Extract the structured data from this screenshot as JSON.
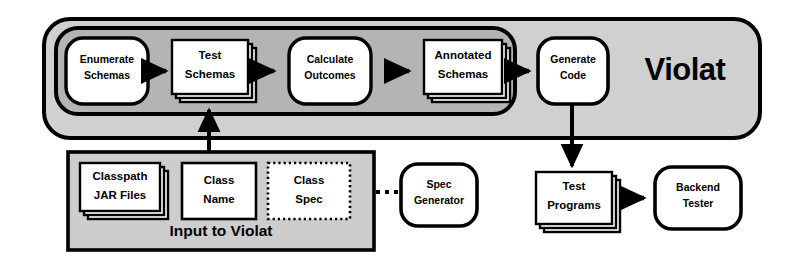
{
  "diagram": {
    "title": "Violat",
    "brand_label": "Violat",
    "input_group_label": "Input to Violat",
    "colors": {
      "background": "#ffffff",
      "outer_container_fill": "#d0d0d0",
      "inner_pipeline_fill": "#b4b4b4",
      "input_group_fill": "#cdcdcd",
      "node_fill": "#ffffff",
      "stroke": "#000000"
    },
    "containers": [
      {
        "id": "violat-container",
        "label": "Violat",
        "shape": "rounded-rectangle",
        "fill": "#d0d0d0"
      },
      {
        "id": "pipeline-band",
        "label": "",
        "shape": "rounded-rectangle",
        "fill": "#b4b4b4"
      },
      {
        "id": "input-to-violat",
        "label": "Input to Violat",
        "shape": "rectangle",
        "fill": "#cdcdcd"
      }
    ],
    "nodes": [
      {
        "id": "enumerate-schemas",
        "lines": [
          "Enumerate",
          "Schemas"
        ],
        "shape": "rounded",
        "stacked": false,
        "border": "solid"
      },
      {
        "id": "test-schemas",
        "lines": [
          "Test",
          "Schemas"
        ],
        "shape": "stack",
        "stacked": true,
        "border": "solid"
      },
      {
        "id": "calculate-outcomes",
        "lines": [
          "Calculate",
          "Outcomes"
        ],
        "shape": "rounded",
        "stacked": false,
        "border": "solid"
      },
      {
        "id": "annotated-schemas",
        "lines": [
          "Annotated",
          "Schemas"
        ],
        "shape": "stack",
        "stacked": true,
        "border": "solid"
      },
      {
        "id": "generate-code",
        "lines": [
          "Generate",
          "Code"
        ],
        "shape": "rounded",
        "stacked": false,
        "border": "solid"
      },
      {
        "id": "classpath-jar-files",
        "lines": [
          "Classpath",
          "JAR Files"
        ],
        "shape": "stack",
        "stacked": true,
        "border": "solid"
      },
      {
        "id": "class-name",
        "lines": [
          "Class",
          "Name"
        ],
        "shape": "rect",
        "stacked": false,
        "border": "solid"
      },
      {
        "id": "class-spec",
        "lines": [
          "Class",
          "Spec"
        ],
        "shape": "rect",
        "stacked": false,
        "border": "dotted"
      },
      {
        "id": "spec-generator",
        "lines": [
          "Spec",
          "Generator"
        ],
        "shape": "rounded",
        "stacked": false,
        "border": "solid"
      },
      {
        "id": "test-programs",
        "lines": [
          "Test",
          "Programs"
        ],
        "shape": "stack",
        "stacked": true,
        "border": "solid"
      },
      {
        "id": "backend-tester",
        "lines": [
          "Backend",
          "Tester"
        ],
        "shape": "rounded",
        "stacked": false,
        "border": "solid"
      }
    ],
    "edges": [
      {
        "id": "enumerate-to-test",
        "from": "enumerate-schemas",
        "to": "test-schemas",
        "style": "solid",
        "direction": "right"
      },
      {
        "id": "test-to-calculate",
        "from": "test-schemas",
        "to": "calculate-outcomes",
        "style": "solid",
        "direction": "right"
      },
      {
        "id": "calculate-to-annotated",
        "from": "calculate-outcomes",
        "to": "annotated-schemas",
        "style": "solid",
        "direction": "right"
      },
      {
        "id": "annotated-to-generate",
        "from": "annotated-schemas",
        "to": "generate-code",
        "style": "solid",
        "direction": "right"
      },
      {
        "id": "input-to-pipeline",
        "from": "input-to-violat",
        "to": "pipeline-band",
        "style": "solid",
        "direction": "up"
      },
      {
        "id": "generate-to-test-programs",
        "from": "generate-code",
        "to": "test-programs",
        "style": "solid",
        "direction": "down"
      },
      {
        "id": "test-programs-to-backend",
        "from": "test-programs",
        "to": "backend-tester",
        "style": "solid",
        "direction": "right"
      },
      {
        "id": "class-spec-to-spec-generator",
        "from": "class-spec",
        "to": "spec-generator",
        "style": "dotted",
        "direction": "left"
      }
    ]
  }
}
